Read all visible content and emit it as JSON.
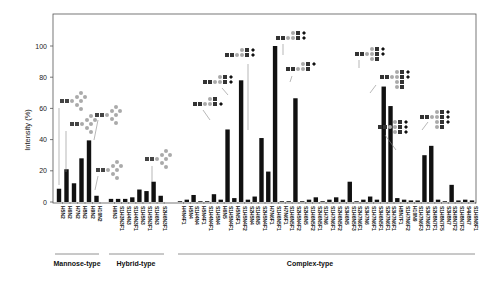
{
  "chart_data": {
    "type": "bar",
    "title": "",
    "xlabel": "",
    "ylabel": "Intensity (%)",
    "ylim": [
      0,
      120
    ],
    "yticks": [
      0,
      20,
      40,
      60,
      80,
      100
    ],
    "grid": false,
    "legend": null,
    "groups": [
      {
        "name": "Mannose-type",
        "start": 0,
        "end": 5
      },
      {
        "name": "Hybrid-type",
        "start": 6,
        "end": 13
      },
      {
        "name": "Complex-type",
        "start": 14,
        "end": 57
      }
    ],
    "categories": [
      "H5N2",
      "H6N2",
      "H7N2",
      "H8N2",
      "H9N2",
      "H10N2",
      "H6N3",
      "S1H3N3F1",
      "S1H4N3",
      "S1H4N3F1",
      "S1H5N3",
      "S1H5N3F1",
      "S1H6N3",
      "S2H6N3F1",
      "H4N4F1",
      "H5N4",
      "S1H4N4",
      "H5N4F1",
      "S1H4N4F1",
      "S1H5N4",
      "H6N5",
      "S1H5N4F1",
      "H5N5F1",
      "S1H5N4F2",
      "S2H5N4",
      "S1H6N5",
      "S2H5N4F1",
      "H7N6F1",
      "S1H6N5F1",
      "H7N6F1b",
      "S1H6N5F1b",
      "S2H5N4F2",
      "S2H6N5",
      "S1H6N5F2",
      "S2H6N5F1",
      "S1H7N6",
      "S1H7N6F1",
      "S2H6N5F2",
      "S3H6N5",
      "S1H6N5F3",
      "S2H7N6F1",
      "S3H7N6",
      "S1H7N6F1b",
      "S3H6N5F1",
      "S2H7N6F1b",
      "S3H7N6F1",
      "H8N7F1",
      "S1H7N6F2",
      "H10N9",
      "S1H7N6F3",
      "S3H7N6F1b",
      "S2H8N7F1",
      "S1H8N7F5",
      "S3H8N7",
      "S2H8N7F2",
      "S1H8N7F3",
      "S4H8N7",
      "S1H9N8F1"
    ],
    "values": [
      8.5,
      21,
      12,
      28,
      39.5,
      4,
      2,
      2,
      2,
      3,
      8,
      7,
      13,
      4,
      0.5,
      1.5,
      4.5,
      0.5,
      0.5,
      5,
      1.5,
      46.5,
      2.5,
      78,
      1.5,
      3.5,
      41,
      19.5,
      100,
      0.5,
      0.5,
      66.5,
      0.5,
      1.5,
      3,
      0.5,
      1.5,
      3,
      1.5,
      13,
      0.5,
      1.5,
      3.5,
      1.5,
      74,
      61.5,
      2.5,
      1.5,
      1,
      1,
      30,
      36,
      1.5,
      0.5,
      11,
      1,
      1.5,
      1
    ],
    "annotations": [
      {
        "target": "H5N2",
        "glycan": "Man5 high-mannose"
      },
      {
        "target": "H6N2",
        "glycan": "Man6 high-mannose"
      },
      {
        "target": "H9N2",
        "glycan": "Man9 high-mannose"
      },
      {
        "target": "H10N2",
        "glycan": "Glc1Man9"
      },
      {
        "target": "S1H6N3",
        "glycan": "hybrid sialylated"
      },
      {
        "target": "S1H5N4F1",
        "glycan": "biantennary sialylated"
      },
      {
        "target": "S1H5N4F2",
        "glycan": "biantennary fucosylated sialylated"
      },
      {
        "target": "S2H5N4",
        "glycan": "biantennary disialylated"
      },
      {
        "target": "S2H5N4F1",
        "glycan": "core-fucosylated disialylated biantennary"
      },
      {
        "target": "H7N6F1",
        "glycan": "triantennary"
      },
      {
        "target": "S2H6N5F2",
        "glycan": "triantennary sialylated fucosylated"
      },
      {
        "target": "S3H7N6",
        "glycan": "triantennary trisialylated"
      },
      {
        "target": "S3H7N6F1",
        "glycan": "tetraantennary sialylated"
      },
      {
        "target": "S2H8N7F1",
        "glycan": "tetraantennary"
      }
    ]
  },
  "axis": {
    "ylabel": "Intensity (%)",
    "ticks": [
      "0",
      "20",
      "40",
      "60",
      "80",
      "100"
    ]
  },
  "groups": {
    "mannose": "Mannose-type",
    "hybrid": "Hybrid-type",
    "complex": "Complex-type"
  }
}
